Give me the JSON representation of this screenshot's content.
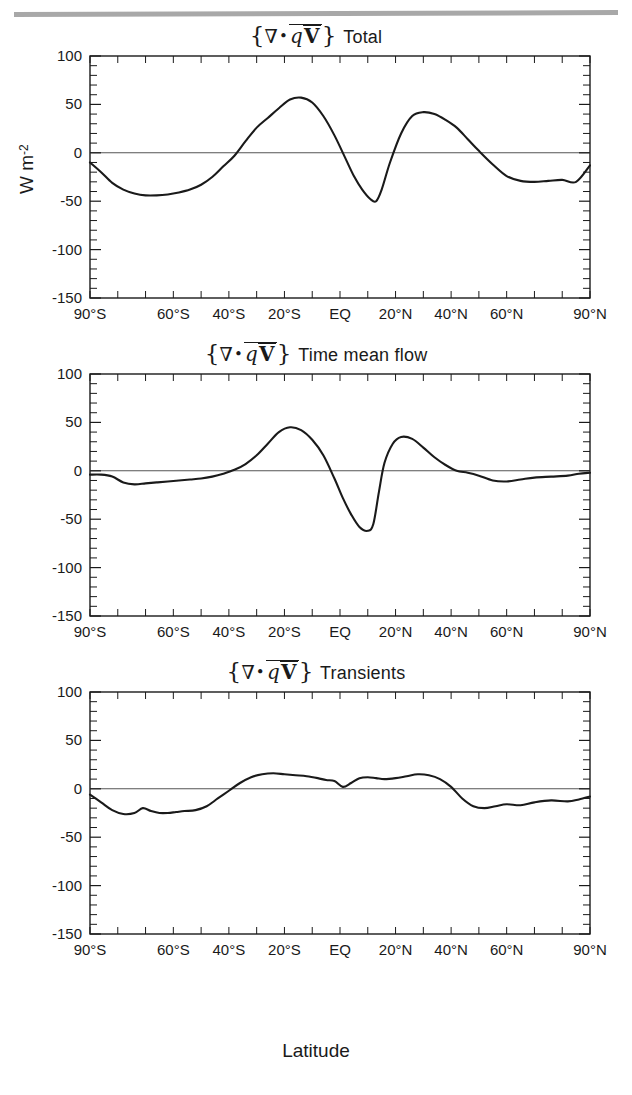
{
  "figure": {
    "xlabel": "Latitude",
    "ylabel_main": "W m",
    "ylabel_exp": "-2",
    "divider": "#a8a8a8"
  },
  "axes": {
    "yticks": [
      100,
      50,
      0,
      -50,
      -100,
      -150
    ],
    "ytick_labels": [
      "100",
      "50",
      "0",
      "-50",
      "-100",
      "-150"
    ],
    "ylim": [
      -150,
      100
    ],
    "xlim": [
      -90,
      90
    ],
    "xtick_values": [
      -90,
      -60,
      -40,
      -20,
      0,
      20,
      40,
      60,
      90
    ],
    "xtick_labels": [
      "90°S",
      "60°S",
      "40°S",
      "20°S",
      "EQ",
      "20°N",
      "40°N",
      "60°N",
      "90°N"
    ],
    "minor_tick_step": 10,
    "grid": false
  },
  "titles": {
    "brace_open": "{",
    "nabla": "∇",
    "dot": "•",
    "q": "q",
    "V": "V",
    "brace_close": "}",
    "panel1_words": "Total",
    "panel2_words": "Time mean flow",
    "panel3_words": "Transients"
  },
  "chart_data": [
    {
      "type": "line",
      "title": "{∇• qV} Total",
      "xlabel": "Latitude",
      "ylabel": "W m-2",
      "xlim": [
        -90,
        90
      ],
      "ylim": [
        -150,
        100
      ],
      "legend": "none",
      "grid": false,
      "series": [
        {
          "name": "Total",
          "x": [
            -90,
            -86,
            -82,
            -78,
            -74,
            -70,
            -66,
            -62,
            -58,
            -54,
            -50,
            -46,
            -42,
            -38,
            -34,
            -30,
            -26,
            -22,
            -18,
            -14,
            -10,
            -6,
            -2,
            2,
            5,
            8,
            11,
            13,
            15,
            18,
            22,
            26,
            30,
            34,
            38,
            42,
            46,
            50,
            55,
            60,
            65,
            70,
            75,
            80,
            85,
            90
          ],
          "y": [
            -10,
            -20,
            -31,
            -38,
            -42,
            -44,
            -44,
            -43,
            -41,
            -38,
            -33,
            -25,
            -14,
            -3,
            12,
            26,
            36,
            46,
            55,
            57,
            52,
            38,
            18,
            -6,
            -24,
            -38,
            -48,
            -50,
            -38,
            -10,
            20,
            38,
            42,
            40,
            34,
            26,
            14,
            2,
            -12,
            -24,
            -29,
            -30,
            -29,
            -28,
            -30,
            -13
          ]
        }
      ]
    },
    {
      "type": "line",
      "title": "{∇• qV} Time mean flow",
      "xlabel": "Latitude",
      "ylabel": "W m-2",
      "xlim": [
        -90,
        90
      ],
      "ylim": [
        -150,
        100
      ],
      "legend": "none",
      "grid": false,
      "series": [
        {
          "name": "Time mean flow",
          "x": [
            -90,
            -86,
            -82,
            -78,
            -74,
            -70,
            -66,
            -62,
            -58,
            -54,
            -50,
            -46,
            -42,
            -38,
            -34,
            -30,
            -26,
            -22,
            -18,
            -14,
            -10,
            -6,
            -2,
            1,
            4,
            7,
            10,
            12,
            14,
            16,
            19,
            22,
            26,
            30,
            34,
            38,
            42,
            46,
            50,
            55,
            60,
            65,
            70,
            76,
            82,
            86,
            90
          ],
          "y": [
            -4,
            -4,
            -6,
            -12,
            -14,
            -13,
            -12,
            -11,
            -10,
            -9,
            -8,
            -6,
            -3,
            1,
            7,
            16,
            28,
            40,
            45,
            42,
            32,
            16,
            -8,
            -28,
            -45,
            -58,
            -62,
            -55,
            -22,
            8,
            28,
            35,
            33,
            24,
            14,
            6,
            0,
            -2,
            -5,
            -10,
            -11,
            -9,
            -7,
            -6,
            -5,
            -3,
            -2
          ]
        }
      ]
    },
    {
      "type": "line",
      "title": "{∇• qV} Transients",
      "xlabel": "Latitude",
      "ylabel": "W m-2",
      "xlim": [
        -90,
        90
      ],
      "ylim": [
        -150,
        100
      ],
      "legend": "none",
      "grid": false,
      "series": [
        {
          "name": "Transients",
          "x": [
            -90,
            -86,
            -82,
            -78,
            -74,
            -71,
            -68,
            -65,
            -62,
            -59,
            -56,
            -52,
            -48,
            -44,
            -40,
            -36,
            -32,
            -28,
            -24,
            -20,
            -16,
            -12,
            -8,
            -5,
            -2,
            1,
            4,
            7,
            10,
            13,
            16,
            20,
            24,
            28,
            32,
            36,
            40,
            44,
            48,
            52,
            56,
            60,
            65,
            70,
            76,
            82,
            86,
            90
          ],
          "y": [
            -6,
            -14,
            -22,
            -26,
            -25,
            -20,
            -23,
            -25,
            -25,
            -24,
            -23,
            -22,
            -18,
            -10,
            -2,
            6,
            12,
            15,
            16,
            15,
            14,
            13,
            11,
            9,
            8,
            2,
            6,
            11,
            12,
            11,
            10,
            11,
            13,
            15,
            14,
            10,
            2,
            -10,
            -18,
            -20,
            -18,
            -16,
            -17,
            -14,
            -12,
            -13,
            -11,
            -8
          ]
        }
      ]
    }
  ]
}
